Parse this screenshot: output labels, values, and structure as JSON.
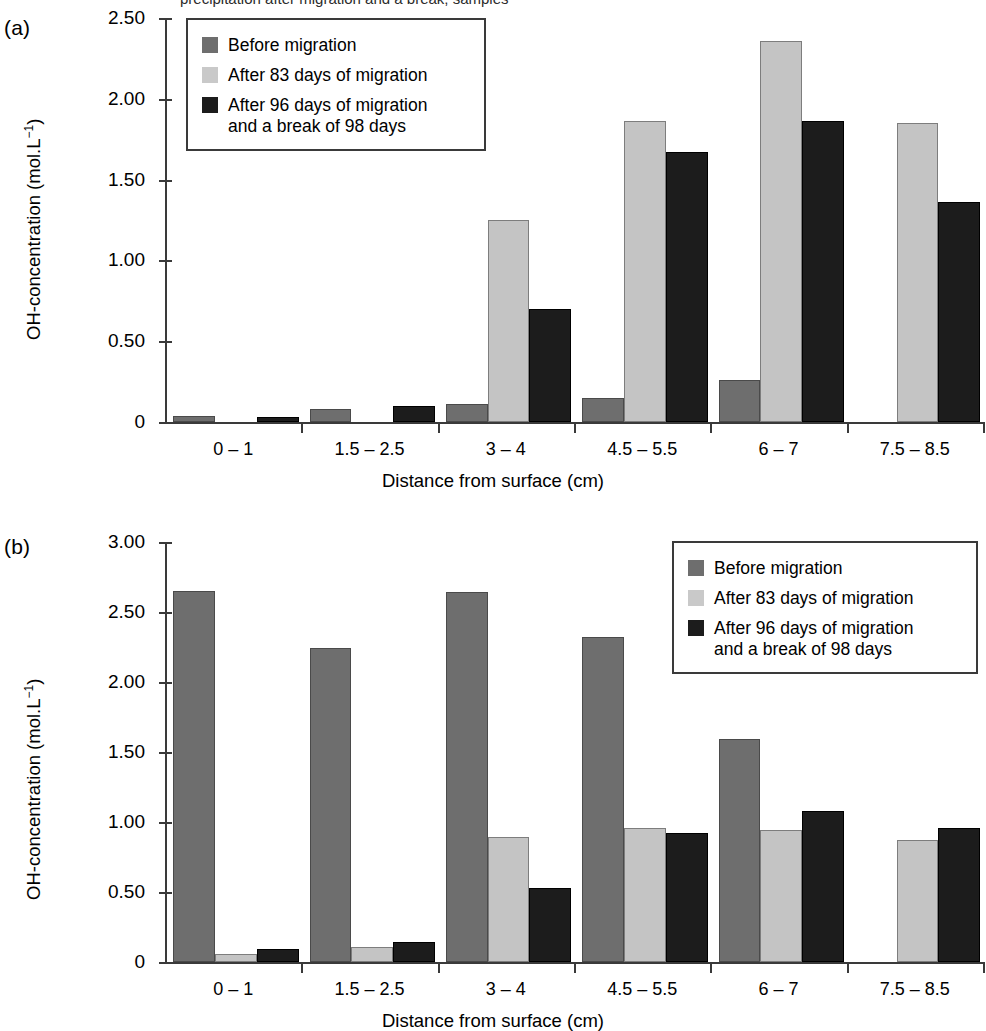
{
  "caption_top_clipped": "precipitation after migration and a break, samples",
  "panels": [
    {
      "letter": "(a)",
      "ylabel_main": "OH-concentration (mol.L",
      "ylabel_sup": "−1",
      "ylabel_close": ")",
      "xlabel": "Distance from surface (cm)",
      "ytick_labels": [
        "0",
        "0.50",
        "1.00",
        "1.50",
        "2.00",
        "2.50"
      ]
    },
    {
      "letter": "(b)",
      "ylabel_main": "OH-concentration (mol.L",
      "ylabel_sup": "−1",
      "ylabel_close": ")",
      "xlabel": "Distance from surface (cm)",
      "ytick_labels": [
        "0",
        "0.50",
        "1.00",
        "1.50",
        "2.00",
        "2.50",
        "3.00"
      ]
    }
  ],
  "legend": {
    "items": [
      {
        "label": "Before migration",
        "color": "#6e6e6e",
        "swatch": "s0"
      },
      {
        "label": "After 83 days of migration",
        "color": "#c9c9c9",
        "swatch": "s1"
      },
      {
        "label": "After 96 days of migration\nand a break of 98 days",
        "color": "#1c1c1c",
        "swatch": "s2"
      }
    ]
  },
  "chart_data": [
    {
      "type": "bar",
      "panel": "(a)",
      "title": "",
      "xlabel": "Distance from surface (cm)",
      "ylabel": "OH-concentration (mol.L−1)",
      "categories": [
        "0 – 1",
        "1.5 – 2.5",
        "3 – 4",
        "4.5 – 5.5",
        "6 – 7",
        "7.5 – 8.5"
      ],
      "ylim": [
        0,
        2.5
      ],
      "yticks": [
        0,
        0.5,
        1.0,
        1.5,
        2.0,
        2.5
      ],
      "grid": false,
      "legend_position": "top-left-inside",
      "series": [
        {
          "name": "Before migration",
          "color": "#6e6e6e",
          "values": [
            0.04,
            0.08,
            0.11,
            0.15,
            0.26,
            null
          ]
        },
        {
          "name": "After 83 days of migration",
          "color": "#c9c9c9",
          "values": [
            null,
            null,
            1.25,
            1.86,
            2.36,
            1.85
          ]
        },
        {
          "name": "After 96 days of migration and a break of 98 days",
          "color": "#1c1c1c",
          "values": [
            0.03,
            0.1,
            0.7,
            1.67,
            1.86,
            1.36
          ]
        }
      ]
    },
    {
      "type": "bar",
      "panel": "(b)",
      "title": "",
      "xlabel": "Distance from surface (cm)",
      "ylabel": "OH-concentration (mol.L−1)",
      "categories": [
        "0 – 1",
        "1.5 – 2.5",
        "3 – 4",
        "4.5 – 5.5",
        "6 – 7",
        "7.5 – 8.5"
      ],
      "ylim": [
        0,
        3.0
      ],
      "yticks": [
        0,
        0.5,
        1.0,
        1.5,
        2.0,
        2.5,
        3.0
      ],
      "grid": false,
      "legend_position": "top-right-inside",
      "series": [
        {
          "name": "Before migration",
          "color": "#6e6e6e",
          "values": [
            2.65,
            2.24,
            2.64,
            2.32,
            1.59,
            null
          ]
        },
        {
          "name": "After 83 days of migration",
          "color": "#c9c9c9",
          "values": [
            0.06,
            0.11,
            0.89,
            0.96,
            0.94,
            0.87
          ]
        },
        {
          "name": "After 96 days of migration and a break of 98 days",
          "color": "#1c1c1c",
          "values": [
            0.09,
            0.14,
            0.53,
            0.92,
            1.08,
            0.96
          ]
        }
      ]
    }
  ]
}
